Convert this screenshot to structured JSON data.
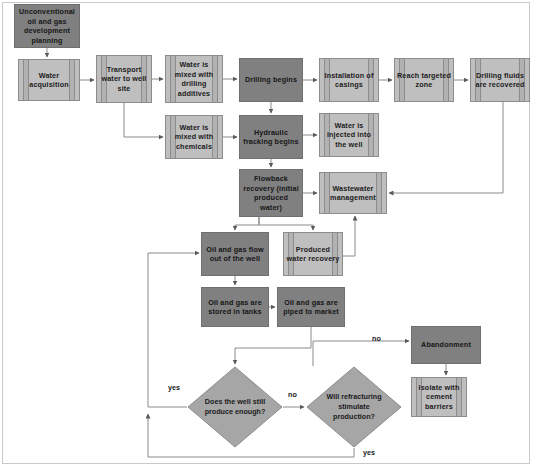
{
  "diagram": {
    "colors": {
      "dark_node": "#808080",
      "light_node": "#bfbfbf",
      "decision": "#a6a6a6",
      "connector": "#808080",
      "frame": "#c9c9c9",
      "background": "#ffffff"
    },
    "nodes": [
      {
        "id": "planning",
        "label": "Unconventional oil and gas development planning",
        "shape": "process",
        "style": "dark",
        "x": 14,
        "y": 4,
        "w": 66,
        "h": 44
      },
      {
        "id": "water_acq",
        "label": "Water acquisition",
        "shape": "predefined-process",
        "style": "light",
        "x": 18,
        "y": 59,
        "w": 62,
        "h": 42
      },
      {
        "id": "transport",
        "label": "Transport water to well site",
        "shape": "predefined-process",
        "style": "light",
        "x": 96,
        "y": 55,
        "w": 56,
        "h": 48
      },
      {
        "id": "mix_drill",
        "label": "Water is mixed with drilling additives",
        "shape": "predefined-process",
        "style": "light",
        "x": 165,
        "y": 55,
        "w": 58,
        "h": 48
      },
      {
        "id": "drilling",
        "label": "Drilling begins",
        "shape": "process",
        "style": "dark",
        "x": 239,
        "y": 58,
        "w": 64,
        "h": 44
      },
      {
        "id": "casings",
        "label": "Installation of casings",
        "shape": "predefined-process",
        "style": "light",
        "x": 319,
        "y": 58,
        "w": 60,
        "h": 44
      },
      {
        "id": "target_zone",
        "label": "Reach targeted zone",
        "shape": "predefined-process",
        "style": "light",
        "x": 394,
        "y": 58,
        "w": 60,
        "h": 44
      },
      {
        "id": "fluids_rec",
        "label": "Drilling fluids are recovered",
        "shape": "predefined-process",
        "style": "light",
        "x": 470,
        "y": 58,
        "w": 60,
        "h": 44
      },
      {
        "id": "mix_chem",
        "label": "Water is mixed with chemicals",
        "shape": "predefined-process",
        "style": "light",
        "x": 165,
        "y": 115,
        "w": 58,
        "h": 44
      },
      {
        "id": "fracking",
        "label": "Hydraulic fracking begins",
        "shape": "process",
        "style": "dark",
        "x": 239,
        "y": 115,
        "w": 64,
        "h": 44
      },
      {
        "id": "injected",
        "label": "Water is injected into the well",
        "shape": "predefined-process",
        "style": "light",
        "x": 319,
        "y": 113,
        "w": 60,
        "h": 44
      },
      {
        "id": "flowback",
        "label": "Flowback recovery (initial produced water)",
        "shape": "process",
        "style": "dark",
        "x": 239,
        "y": 169,
        "w": 64,
        "h": 48
      },
      {
        "id": "wastewater",
        "label": "Wastewater management",
        "shape": "predefined-process",
        "style": "light",
        "x": 319,
        "y": 172,
        "w": 68,
        "h": 42
      },
      {
        "id": "flow_out",
        "label": "Oil and gas flow out of the well",
        "shape": "process",
        "style": "dark",
        "x": 201,
        "y": 232,
        "w": 68,
        "h": 44
      },
      {
        "id": "produced_water",
        "label": "Produced water recovery",
        "shape": "predefined-process",
        "style": "light",
        "x": 283,
        "y": 232,
        "w": 60,
        "h": 44
      },
      {
        "id": "stored_tanks",
        "label": "Oil and gas are stored in tanks",
        "shape": "process",
        "style": "dark",
        "x": 201,
        "y": 287,
        "w": 68,
        "h": 40
      },
      {
        "id": "piped_market",
        "label": "Oil and gas are piped to market",
        "shape": "process",
        "style": "dark",
        "x": 277,
        "y": 287,
        "w": 68,
        "h": 40
      },
      {
        "id": "abandonment",
        "label": "Abandonment",
        "shape": "process",
        "style": "dark",
        "x": 411,
        "y": 326,
        "w": 70,
        "h": 38
      },
      {
        "id": "isolate",
        "label": "Isolate with cement barriers",
        "shape": "predefined-process",
        "style": "light",
        "x": 411,
        "y": 377,
        "w": 56,
        "h": 40
      }
    ],
    "decisions": [
      {
        "id": "still_produce",
        "label": "Does the well still produce enough?",
        "x": 187,
        "y": 366,
        "w": 96,
        "h": 82
      },
      {
        "id": "refracture",
        "label": "Will refracturing stimulate production?",
        "x": 306,
        "y": 366,
        "w": 96,
        "h": 82
      }
    ],
    "edge_labels": [
      {
        "id": "yes-left",
        "text": "yes",
        "x": 168,
        "y": 383
      },
      {
        "id": "no-middle",
        "text": "no",
        "x": 288,
        "y": 390
      },
      {
        "id": "no-right",
        "text": "no",
        "x": 372,
        "y": 334
      },
      {
        "id": "yes-bottom",
        "text": "yes",
        "x": 363,
        "y": 448
      }
    ]
  }
}
